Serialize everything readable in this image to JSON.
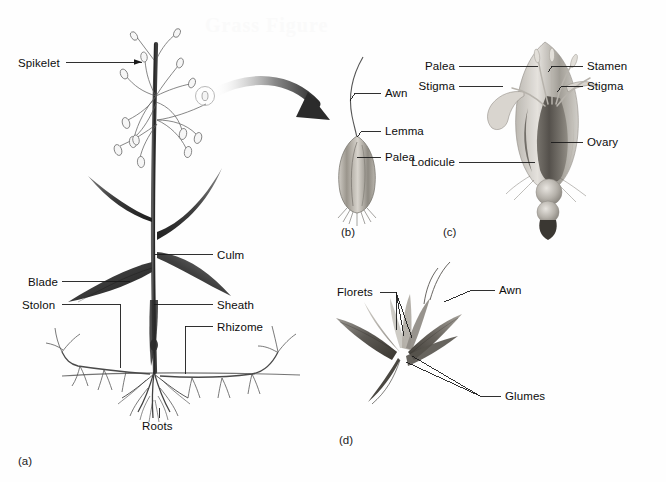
{
  "figure": {
    "watermark": "Grass Figure",
    "background_color": "#ffffff",
    "ink_color": "#111111",
    "leader_color": "#1a1a1a"
  },
  "panels": [
    {
      "letter": "(a)",
      "caption": "Whole grass plant",
      "labels": [
        {
          "text": "Spikelet",
          "side": "left",
          "x": 18,
          "y": 57
        },
        {
          "text": "Culm",
          "side": "right",
          "x": 217,
          "y": 250
        },
        {
          "text": "Blade",
          "side": "left",
          "x": 28,
          "y": 277
        },
        {
          "text": "Sheath",
          "side": "right",
          "x": 217,
          "y": 300
        },
        {
          "text": "Stolon",
          "side": "left",
          "x": 26,
          "y": 300
        },
        {
          "text": "Rhizome",
          "side": "right",
          "x": 217,
          "y": 322
        },
        {
          "text": "Roots",
          "side": "center",
          "x": 143,
          "y": 420
        }
      ]
    },
    {
      "letter": "(b)",
      "caption": "Single floret",
      "labels": [
        {
          "text": "Awn",
          "side": "right",
          "x": 385,
          "y": 89
        },
        {
          "text": "Lemma",
          "side": "right",
          "x": 385,
          "y": 127
        },
        {
          "text": "Palea",
          "side": "right",
          "x": 385,
          "y": 153
        }
      ]
    },
    {
      "letter": "(c)",
      "caption": "Floret dissection",
      "labels": [
        {
          "text": "Palea",
          "side": "left",
          "x": 455,
          "y": 62
        },
        {
          "text": "Stamen",
          "side": "right",
          "x": 587,
          "y": 62
        },
        {
          "text": "Stigma",
          "side": "left",
          "x": 452,
          "y": 82
        },
        {
          "text": "Stigma",
          "side": "right",
          "x": 587,
          "y": 82
        },
        {
          "text": "Ovary",
          "side": "right",
          "x": 587,
          "y": 138
        },
        {
          "text": "Lodicule",
          "side": "left",
          "x": 445,
          "y": 158
        }
      ]
    },
    {
      "letter": "(d)",
      "caption": "Spikelet with glumes",
      "labels": [
        {
          "text": "Florets",
          "side": "left",
          "x": 340,
          "y": 287
        },
        {
          "text": "Awn",
          "side": "right",
          "x": 499,
          "y": 285
        },
        {
          "text": "Glumes",
          "side": "right",
          "x": 505,
          "y": 391
        }
      ]
    }
  ],
  "panel_letters": [
    {
      "text": "(a)",
      "x": 18,
      "y": 455
    },
    {
      "text": "(b)",
      "x": 341,
      "y": 226
    },
    {
      "text": "(c)",
      "x": 443,
      "y": 226
    },
    {
      "text": "(d)",
      "x": 339,
      "y": 434
    }
  ]
}
